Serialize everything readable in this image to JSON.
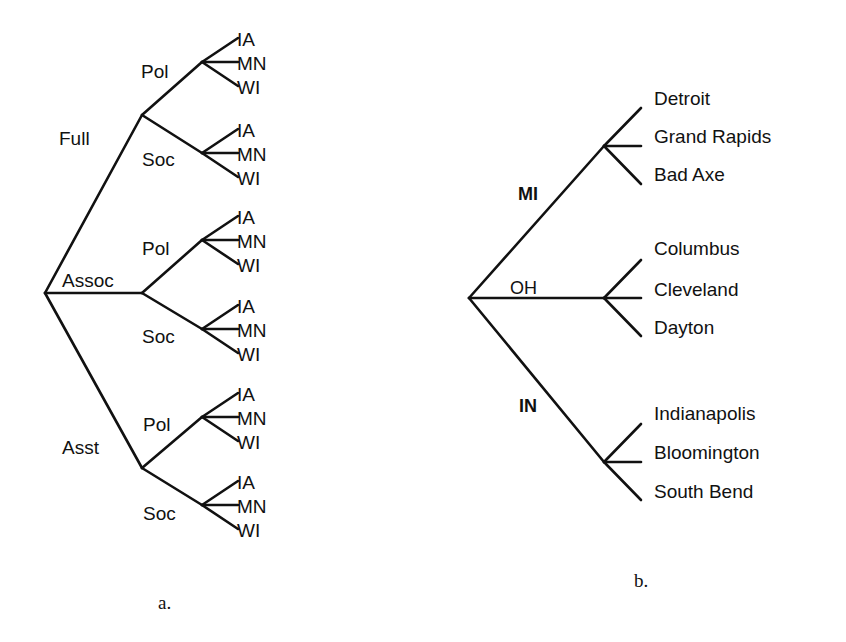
{
  "figure_a": {
    "caption": "a.",
    "root": {
      "x": 45,
      "y": 293
    },
    "level1": [
      {
        "label": "Full",
        "x": 142,
        "y": 115,
        "label_x": 59,
        "label_y": 145,
        "children": [
          {
            "label": "Pol",
            "x": 202,
            "y": 62,
            "label_x": 141,
            "label_y": 78
          },
          {
            "label": "Soc",
            "x": 202,
            "y": 153,
            "label_x": 142,
            "label_y": 166
          }
        ]
      },
      {
        "label": "Assoc",
        "x": 142,
        "y": 293,
        "label_x": 62,
        "label_y": 287,
        "children": [
          {
            "label": "Pol",
            "x": 202,
            "y": 240,
            "label_x": 142,
            "label_y": 255
          },
          {
            "label": "Soc",
            "x": 202,
            "y": 329,
            "label_x": 142,
            "label_y": 343
          }
        ]
      },
      {
        "label": "Asst",
        "x": 142,
        "y": 468,
        "label_x": 62,
        "label_y": 454,
        "children": [
          {
            "label": "Pol",
            "x": 202,
            "y": 417,
            "label_x": 143,
            "label_y": 431
          },
          {
            "label": "Soc",
            "x": 202,
            "y": 505,
            "label_x": 143,
            "label_y": 520
          }
        ]
      }
    ],
    "leaves": [
      "IA",
      "MN",
      "WI"
    ]
  },
  "figure_b": {
    "caption": "b.",
    "root": {
      "x": 469,
      "y": 298
    },
    "states": [
      {
        "label": "MI",
        "x": 604,
        "y": 146,
        "label_x": 518,
        "label_y": 200,
        "cities": [
          "Detroit",
          "Grand Rapids",
          "Bad Axe"
        ]
      },
      {
        "label": "OH",
        "x": 604,
        "y": 298,
        "label_x": 510,
        "label_y": 294,
        "cities": [
          "Columbus",
          "Cleveland",
          "Dayton"
        ]
      },
      {
        "label": "IN",
        "x": 604,
        "y": 462,
        "label_x": 519,
        "label_y": 412,
        "cities": [
          "Indianapolis",
          "Bloomington",
          "South Bend"
        ]
      }
    ]
  }
}
